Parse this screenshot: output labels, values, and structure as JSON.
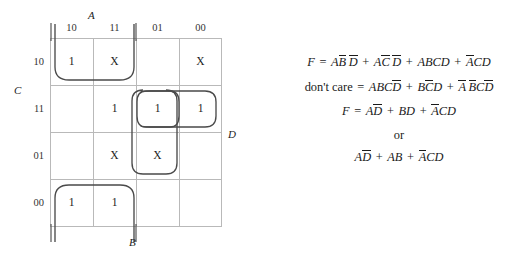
{
  "figure": {
    "type": "karnaugh-map-with-equations"
  },
  "kmap": {
    "variable_labels": {
      "top": "A",
      "left": "C",
      "right": "D",
      "bottom": "B"
    },
    "column_headers": [
      "10",
      "11",
      "01",
      "00"
    ],
    "row_headers": [
      "10",
      "11",
      "01",
      "00"
    ],
    "cells": [
      [
        "1",
        "X",
        "",
        "X"
      ],
      [
        "",
        "1",
        "1",
        "1"
      ],
      [
        "",
        "X",
        "X",
        ""
      ],
      [
        "1",
        "1",
        "",
        ""
      ]
    ],
    "groups": [
      {
        "name": "group-top-left",
        "cells": "row10-col10,row10-col11"
      },
      {
        "name": "group-middle-row",
        "cells": "row11-col11,row11-col01,row11-col00"
      },
      {
        "name": "group-single-oval",
        "cells": "row11-col01"
      },
      {
        "name": "group-vertical-middle",
        "cells": "row11-col11,row11-col01,row01-col11,row01-col01"
      },
      {
        "name": "group-bottom-left",
        "cells": "row00-col10,row00-col11"
      }
    ]
  },
  "equations": {
    "line1": {
      "lhs": "F",
      "eq": "=",
      "terms": [
        {
          "parts": [
            {
              "t": "A",
              "bar": false
            },
            {
              "t": "B",
              "bar": true
            },
            {
              "t": "D",
              "bar": true
            }
          ]
        },
        {
          "parts": [
            {
              "t": "A",
              "bar": false
            },
            {
              "t": "C",
              "bar": true
            },
            {
              "t": "D",
              "bar": true
            }
          ]
        },
        {
          "parts": [
            {
              "t": "A",
              "bar": false
            },
            {
              "t": "B",
              "bar": false
            },
            {
              "t": "C",
              "bar": false
            },
            {
              "t": "D",
              "bar": false
            }
          ]
        },
        {
          "parts": [
            {
              "t": "A",
              "bar": true
            },
            {
              "t": "C",
              "bar": false
            },
            {
              "t": "D",
              "bar": false
            }
          ]
        }
      ],
      "text": "F = AB̄D̄ + AC̄D̄ + ABCD + ĀCD"
    },
    "line2": {
      "lhs": "don't care",
      "eq": "=",
      "terms": [
        {
          "parts": [
            {
              "t": "A",
              "bar": false
            },
            {
              "t": "B",
              "bar": false
            },
            {
              "t": "C",
              "bar": false
            },
            {
              "t": "D",
              "bar": true
            }
          ]
        },
        {
          "parts": [
            {
              "t": "B",
              "bar": false
            },
            {
              "t": "C",
              "bar": true
            },
            {
              "t": "D",
              "bar": false
            }
          ]
        },
        {
          "parts": [
            {
              "t": "A",
              "bar": true
            },
            {
              "t": "B",
              "bar": true
            },
            {
              "t": "C",
              "bar": false
            },
            {
              "t": "D",
              "bar": true
            }
          ]
        }
      ],
      "text": "don't care = ABCD̄ + BC̄D + ĀB̄CD̄"
    },
    "line3": {
      "lhs": "F",
      "eq": "=",
      "terms": [
        {
          "parts": [
            {
              "t": "A",
              "bar": false
            },
            {
              "t": "D",
              "bar": true
            }
          ]
        },
        {
          "parts": [
            {
              "t": "B",
              "bar": false
            },
            {
              "t": "D",
              "bar": false
            }
          ]
        },
        {
          "parts": [
            {
              "t": "A",
              "bar": true
            },
            {
              "t": "C",
              "bar": false
            },
            {
              "t": "D",
              "bar": false
            }
          ]
        }
      ],
      "text": "F = AD̄ + BD + ĀCD"
    },
    "or_label": "or",
    "line4": {
      "terms": [
        {
          "parts": [
            {
              "t": "A",
              "bar": false
            },
            {
              "t": "D",
              "bar": true
            }
          ]
        },
        {
          "parts": [
            {
              "t": "A",
              "bar": false
            },
            {
              "t": "B",
              "bar": false
            }
          ]
        },
        {
          "parts": [
            {
              "t": "A",
              "bar": true
            },
            {
              "t": "C",
              "bar": false
            },
            {
              "t": "D",
              "bar": false
            }
          ]
        }
      ],
      "text": "AD̄ + AB + ĀCD"
    },
    "plus": "+",
    "equals": "="
  },
  "colors": {
    "grid": "#b9b9b9",
    "group": "#4a4a4a",
    "bracket": "#555555",
    "text": "#1a1a1a"
  }
}
